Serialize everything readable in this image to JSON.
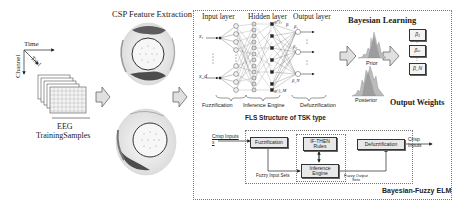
{
  "eeg_samples": {
    "axis_time": "Time",
    "axis_trial": "Trial",
    "axis_channel": "Channel",
    "label_line1": "EEG",
    "label_line2": "TrainingSamples"
  },
  "csp": {
    "title": "CSP Feature Extraction"
  },
  "network": {
    "input_layer": "Input layer",
    "hidden_layer": "Hidden layer",
    "output_layer": "Output layer",
    "input_top": "x₁",
    "input_bottom": "x_d",
    "hidden_top_label": "g(·)₁",
    "hidden_bottom_label": "g(·)_M",
    "beta_label": "β",
    "output_labels": [
      "β₁",
      "β₂",
      "β_N"
    ],
    "stage_labels": [
      "Fuzzification",
      "Inference Engine",
      "Defuzzification"
    ],
    "subtitle": "FLS Structure of TSK type"
  },
  "bayesian": {
    "title": "Bayesian Learning",
    "prior_label": "Prior",
    "posterior_label": "Posterior",
    "weights_title": "Output Weights",
    "weight_boxes": [
      "β₁",
      "βₘ",
      "β_N"
    ]
  },
  "fls_block": {
    "crisp_input": "Crisp Inputs x",
    "fuzzification": "Fuzzification",
    "rules": "IF-THEN Rules",
    "inference": "Inference Engine",
    "defuzzification": "Defuzzification",
    "crisp_output": "Crisp Inputs",
    "fuzzy_input_sets": "Fuzzy Input Sets",
    "fuzzy_output_sets": "Fuzzy Output Sets"
  },
  "frame": {
    "label": "Bayesian-Fuzzy ELM"
  },
  "colors": {
    "line": "#333333",
    "box_fill": "#e8e8e8",
    "arrow_fill": "#e0e0e0",
    "dotted": "#777777"
  }
}
